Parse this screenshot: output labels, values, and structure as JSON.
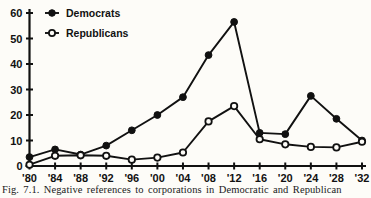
{
  "figure": {
    "caption": "Fig. 7.1. Negative references to corporations in Democratic and Republican",
    "background_color": "#fdfcf8",
    "ink_color": "#111111"
  },
  "chart_data": {
    "type": "line",
    "title": "",
    "xlabel": "",
    "ylabel": "",
    "categories": [
      "'80",
      "'84",
      "'88",
      "'92",
      "'96",
      "'00",
      "'04",
      "'08",
      "'12",
      "'16",
      "'20",
      "'24",
      "'28",
      "'32"
    ],
    "yticks": [
      0,
      10,
      20,
      30,
      40,
      50,
      60
    ],
    "ylim": [
      0,
      60
    ],
    "grid": false,
    "legend_position": "top-left",
    "series": [
      {
        "name": "Democrats",
        "marker": "filled-circle",
        "values": [
          3.5,
          6.5,
          4.5,
          8,
          14,
          20,
          27,
          43.5,
          56.5,
          13,
          12.5,
          27.5,
          18.5,
          10
        ]
      },
      {
        "name": "Republicans",
        "marker": "open-circle",
        "values": [
          0.5,
          4,
          4.2,
          4,
          2.5,
          3.3,
          5.3,
          17.5,
          23.5,
          10.5,
          8.5,
          7.5,
          7.3,
          9.5
        ]
      }
    ]
  },
  "legend": {
    "items": [
      {
        "label": "Democrats",
        "marker": "filled-circle"
      },
      {
        "label": "Republicans",
        "marker": "open-circle"
      }
    ]
  }
}
